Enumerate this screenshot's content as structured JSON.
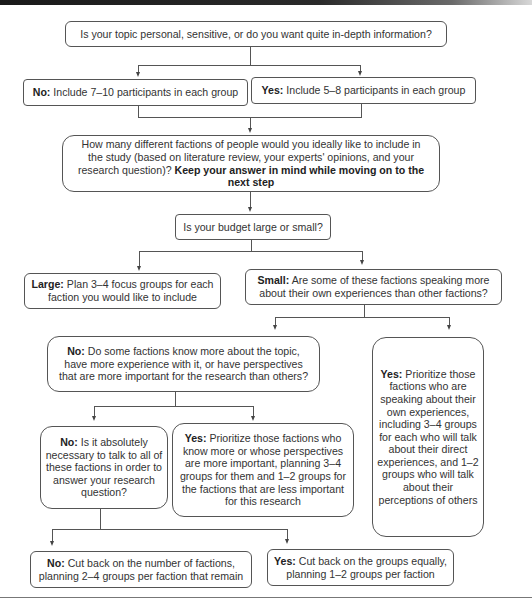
{
  "diagram": {
    "q1": {
      "text": "Is your topic personal, sensitive, or do you want quite in-depth information?"
    },
    "q1_no": {
      "label": "No:",
      "text": " Include 7–10 participants in each group"
    },
    "q1_yes": {
      "label": "Yes:",
      "text": " Include 5–8 participants in each group"
    },
    "q2": {
      "text": "How many different factions of people would you ideally like to include in the study (based on literature review, your experts' opinions, and your research question)? ",
      "emphasis": "Keep your answer in mind while moving on to the next step"
    },
    "q3": {
      "text": "Is your budget large or small?"
    },
    "large": {
      "label": "Large:",
      "text": " Plan 3–4 focus groups for each faction you would like to include"
    },
    "small": {
      "label": "Small:",
      "text": " Are some of these factions speaking more about their own experiences than other factions?"
    },
    "small_no": {
      "label": "No:",
      "text": " Do some factions know more about the topic, have more experience with it, or have perspectives that are more important for the research than others?"
    },
    "small_yes": {
      "label": "Yes:",
      "text": " Prioritize those factions who are speaking about their own experiences, including 3–4 groups for each who will talk about their direct experiences, and 1–2 groups who will talk about their perceptions of others"
    },
    "know_no": {
      "label": "No:",
      "text": " Is it absolutely necessary to talk to all of these factions in order to answer your research question?"
    },
    "know_yes": {
      "label": "Yes:",
      "text": " Prioritize those factions who know more or whose perspectives are more important, planning 3–4 groups for them and 1–2 groups for the factions that are less important for this research"
    },
    "necessary_no": {
      "label": "No:",
      "text": " Cut back on the number of factions, planning 2–4 groups per faction that remain"
    },
    "necessary_yes": {
      "label": "Yes:",
      "text": " Cut back on the groups equally, planning 1–2 groups per faction"
    }
  }
}
